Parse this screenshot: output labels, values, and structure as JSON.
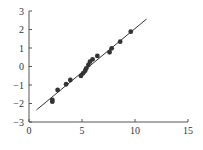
{
  "chart_data": {
    "type": "scatter",
    "title": "",
    "xlabel": "",
    "ylabel": "",
    "xlim": [
      0,
      15
    ],
    "ylim": [
      -3,
      3
    ],
    "grid": false,
    "legend": null,
    "x_ticks": [
      "0",
      "5",
      "10",
      "15"
    ],
    "y_ticks": [
      "3",
      "2",
      "1",
      "0",
      "−1",
      "−2",
      "−3"
    ],
    "series": [
      {
        "name": "points",
        "type": "scatter",
        "x": [
          2.2,
          2.2,
          2.7,
          3.5,
          3.9,
          4.9,
          5.1,
          5.3,
          5.4,
          5.6,
          5.75,
          6.0,
          6.45,
          7.6,
          7.8,
          8.6,
          9.6
        ],
        "y": [
          -1.8,
          -1.9,
          -1.27,
          -0.96,
          -0.73,
          -0.51,
          -0.37,
          -0.23,
          -0.1,
          0.08,
          0.26,
          0.39,
          0.57,
          0.77,
          0.98,
          1.34,
          1.88
        ]
      },
      {
        "name": "fit line",
        "type": "line",
        "x": [
          0.7,
          11.1
        ],
        "y": [
          -2.35,
          2.57
        ]
      }
    ],
    "colors": {
      "points": "#333333",
      "line": "#333333",
      "axes": "#555555"
    }
  }
}
